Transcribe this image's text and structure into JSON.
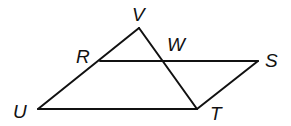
{
  "diagram": {
    "type": "geometry",
    "line_color": "#111111",
    "points": {
      "V": {
        "label": "V",
        "x": 139,
        "y": 28,
        "lx": 132,
        "ly": 21
      },
      "R": {
        "label": "R",
        "x": 100,
        "y": 61,
        "lx": 76,
        "ly": 63
      },
      "W": {
        "label": "W",
        "x": 162,
        "y": 61,
        "lx": 167,
        "ly": 51
      },
      "S": {
        "label": "S",
        "x": 258,
        "y": 61,
        "lx": 265,
        "ly": 67
      },
      "U": {
        "label": "U",
        "x": 38,
        "y": 109,
        "lx": 13,
        "ly": 118
      },
      "T": {
        "label": "T",
        "x": 197,
        "y": 109,
        "lx": 210,
        "ly": 120
      }
    },
    "segments": [
      [
        "U",
        "V"
      ],
      [
        "V",
        "T"
      ],
      [
        "U",
        "T"
      ],
      [
        "R",
        "S"
      ],
      [
        "S",
        "T"
      ]
    ]
  }
}
